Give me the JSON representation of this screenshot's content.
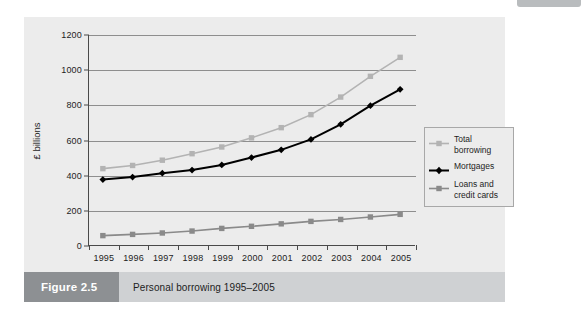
{
  "figure": {
    "number_label": "Figure 2.5",
    "caption": "Personal borrowing 1995–2005"
  },
  "colors": {
    "total_borrowing": "#b3b3b3",
    "mortgages": "#000000",
    "loans_and_credit_cards": "#8a8a8a",
    "panel_background": "#ececec",
    "gridline": "#8e8e8e",
    "axis": "#4a4a4a",
    "caption_number_background": "#8d9093",
    "caption_text_background": "#cfd1d3"
  },
  "chart_data": {
    "type": "line",
    "title": "Personal borrowing 1995–2005",
    "xlabel": "",
    "ylabel": "£ billions",
    "categories": [
      "1995",
      "1996",
      "1997",
      "1998",
      "1999",
      "2000",
      "2001",
      "2002",
      "2003",
      "2004",
      "2005"
    ],
    "ylim": [
      0,
      1200
    ],
    "yticks": [
      0,
      200,
      400,
      600,
      800,
      1000,
      1200
    ],
    "grid": true,
    "legend_position": "right",
    "series": [
      {
        "name": "Total borrowing",
        "color": "#b3b3b3",
        "marker": "square",
        "values": [
          440,
          458,
          488,
          525,
          563,
          615,
          673,
          747,
          847,
          965,
          1073
        ]
      },
      {
        "name": "Mortgages",
        "color": "#000000",
        "marker": "diamond",
        "values": [
          378,
          392,
          414,
          432,
          461,
          503,
          547,
          606,
          692,
          798,
          891
        ]
      },
      {
        "name": "Loans and\ncredit cards",
        "color": "#8a8a8a",
        "marker": "square",
        "values": [
          59,
          66,
          74,
          85,
          100,
          112,
          126,
          140,
          151,
          165,
          180
        ]
      }
    ]
  }
}
